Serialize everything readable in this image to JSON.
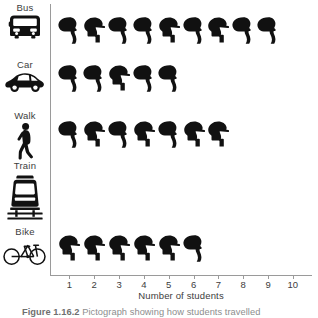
{
  "figure": {
    "caption_number": "Figure 1.16.2",
    "caption_text": "Pictograph showing how students travelled"
  },
  "axes": {
    "x_title": "Number of students",
    "x_ticks": [
      "1",
      "2",
      "3",
      "4",
      "5",
      "6",
      "7",
      "8",
      "9",
      "10"
    ],
    "axis_color": "#9a9a9a",
    "text_color": "#3d3d3d"
  },
  "symbol": {
    "name": "student-head-icon",
    "color": "#111111",
    "meaning": "1 student"
  },
  "categories": [
    {
      "label": "Bus",
      "icon": "bus-icon",
      "count": 9
    },
    {
      "label": "Car",
      "icon": "car-icon",
      "count": 5
    },
    {
      "label": "Walk",
      "icon": "walk-icon",
      "count": 7
    },
    {
      "label": "Train",
      "icon": "train-icon",
      "count": 0
    },
    {
      "label": "Bike",
      "icon": "bike-icon",
      "count": 6
    }
  ],
  "chart_data": {
    "type": "bar",
    "subtype": "pictograph",
    "title": "Pictograph showing how students travelled",
    "categories": [
      "Bus",
      "Car",
      "Walk",
      "Train",
      "Bike"
    ],
    "values": [
      9,
      5,
      7,
      0,
      6
    ],
    "xlabel": "Number of students",
    "ylabel": "",
    "xlim": [
      0,
      10
    ],
    "xticks": [
      1,
      2,
      3,
      4,
      5,
      6,
      7,
      8,
      9,
      10
    ],
    "grid": false,
    "legend": false,
    "symbol_value": 1,
    "orientation": "horizontal"
  }
}
